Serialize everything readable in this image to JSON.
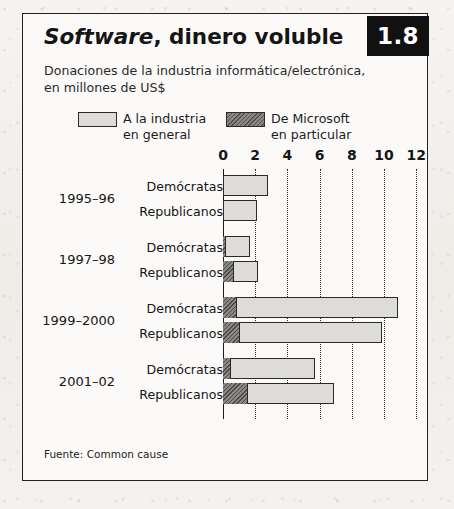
{
  "figure": {
    "number": "1.8",
    "title_italic": "Software",
    "title_rest": ", dinero voluble",
    "subtitle": "Donaciones de la industria informática/electrónica, en millones de US$",
    "source": "Fuente: Common cause"
  },
  "legend": {
    "items": [
      {
        "key": "industry",
        "line1": "A la industria",
        "line2": "en general",
        "color": "#dedcd8"
      },
      {
        "key": "microsoft",
        "line1": "De Microsoft",
        "line2": "en particular",
        "color": "#8a8884"
      }
    ]
  },
  "chart_data": {
    "type": "bar",
    "orientation": "horizontal",
    "stacked": true,
    "title": "Software, dinero voluble",
    "subtitle": "Donaciones de la industria informática/electrónica, en millones de US$",
    "xlabel": "",
    "ylabel": "",
    "xlim": [
      0,
      12
    ],
    "xticks": [
      0,
      2,
      4,
      6,
      8,
      10,
      12
    ],
    "xtick_labels": [
      "0",
      "2",
      "4",
      "6",
      "8",
      "10",
      "12"
    ],
    "grid": "vertical-dotted",
    "legend_position": "top",
    "series": [
      {
        "name": "De Microsoft en particular",
        "color": "#8a8884"
      },
      {
        "name": "A la industria en general",
        "color": "#dedcd8"
      }
    ],
    "groups": [
      {
        "label": "1995–96",
        "bars": [
          {
            "category": "Demócratas",
            "microsoft": 0.0,
            "total": 2.8
          },
          {
            "category": "Republicanos",
            "microsoft": 0.0,
            "total": 2.1
          }
        ]
      },
      {
        "label": "1997–98",
        "bars": [
          {
            "category": "Demócratas",
            "microsoft": 0.2,
            "total": 1.7
          },
          {
            "category": "Republicanos",
            "microsoft": 0.7,
            "total": 2.2
          }
        ]
      },
      {
        "label": "1999–2000",
        "bars": [
          {
            "category": "Demócratas",
            "microsoft": 0.9,
            "total": 10.9
          },
          {
            "category": "Republicanos",
            "microsoft": 1.1,
            "total": 9.9
          }
        ]
      },
      {
        "label": "2001–02",
        "bars": [
          {
            "category": "Demócratas",
            "microsoft": 0.5,
            "total": 5.7
          },
          {
            "category": "Republicanos",
            "microsoft": 1.6,
            "total": 6.9
          }
        ]
      }
    ],
    "units": "millions of US$",
    "source": "Common cause"
  }
}
